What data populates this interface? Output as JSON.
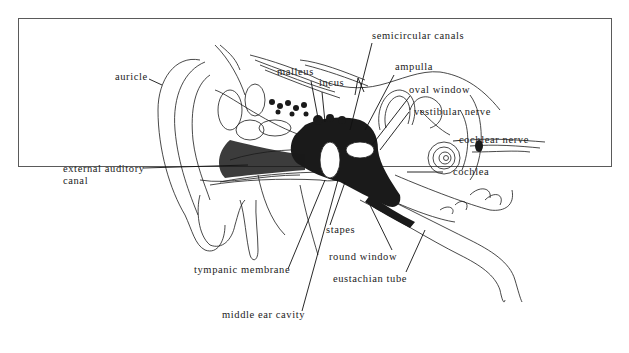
{
  "figure": {
    "border_color": "#5a5a5a",
    "ink_color": "#1a1a1a",
    "labels": {
      "auricle": "auricle",
      "external_auditory_canal_line1": "external auditory",
      "external_auditory_canal_line2": "canal",
      "malleus": "malleus",
      "incus": "incus",
      "semicircular_canals": "semicircular canals",
      "ampulla": "ampulla",
      "oval_window": "oval window",
      "vestibular_nerve": "vestibular nerve",
      "cochlear_nerve": "cochlear nerve",
      "cochlea": "cochlea",
      "stapes": "stapes",
      "round_window": "round window",
      "eustachian_tube": "eustachian tube",
      "tympanic_membrane": "tympanic membrane",
      "middle_ear_cavity": "middle ear cavity"
    }
  }
}
